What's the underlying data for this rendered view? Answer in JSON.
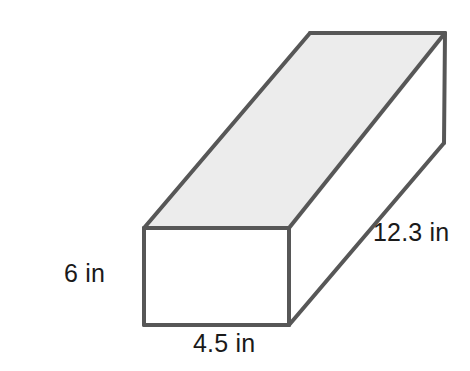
{
  "figure": {
    "type": "rectangular-prism-diagram",
    "shape_name": "rectangular prism",
    "fill_color": "#ececec",
    "stroke_color": "#575757",
    "background_color": "#ffffff",
    "faces": {
      "front": {
        "name": "front-face",
        "fill": "#ffffff",
        "points": "144,228 289,228 289,325 144,325"
      },
      "top": {
        "name": "top-face",
        "fill": "#ececec",
        "points": "144,228 310,33 445,33 289,228"
      },
      "right": {
        "name": "right-face",
        "fill": "#ffffff",
        "points": "289,228 445,33 445,143 289,325"
      }
    },
    "labels": {
      "height": "6 in",
      "width": "4.5 in",
      "depth": "12.3 in"
    },
    "dimensions": {
      "height_value": 6,
      "width_value": 4.5,
      "depth_value": 12.3,
      "unit": "in"
    }
  }
}
